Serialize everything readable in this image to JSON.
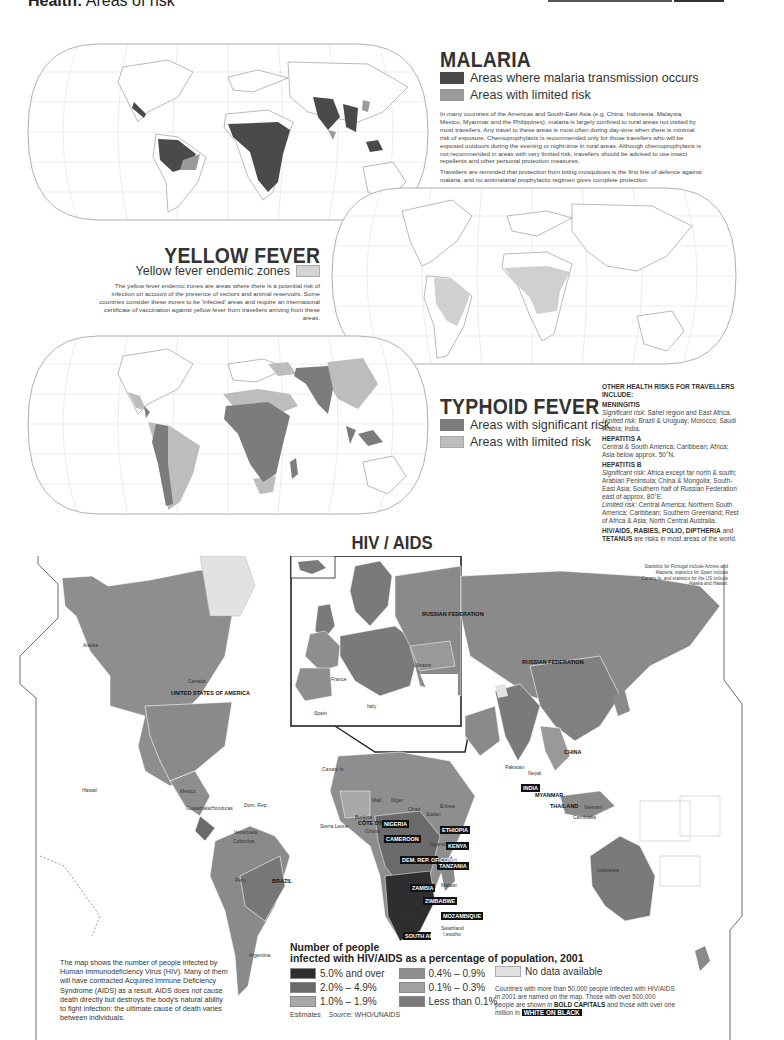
{
  "header": {
    "title_bold": "Health:",
    "title_light": " Areas of risk"
  },
  "colors": {
    "malaria_transmission": "#4a4a4a",
    "malaria_limited": "#9a9a9a",
    "yellow_fever": "#d4d4d4",
    "typhoid_significant": "#7c7c7c",
    "typhoid_limited": "#bdbdbd",
    "hiv_5_plus": "#2e2e2e",
    "hiv_2_4_9": "#6a6a6a",
    "hiv_1_1_9": "#a8a8a8",
    "hiv_0_4_0_9": "#8e8e8e",
    "hiv_0_1_0_3": "#a0a0a0",
    "hiv_lt_0_1": "#7a7a7a",
    "hiv_no_data": "#e2e2e2",
    "land": "#ffffff",
    "coast": "#8c8c8c",
    "grid": "#cfcfcf"
  },
  "malaria": {
    "title": "MALARIA",
    "legend": [
      {
        "label": "Areas where malaria transmission occurs",
        "color_key": "malaria_transmission"
      },
      {
        "label": "Areas with limited risk",
        "color_key": "malaria_limited"
      }
    ],
    "paragraphs": [
      "In many countries of the Americas and South-East Asia (e.g. China, Indonesia, Malaysia, Mexico, Myanmar and the Philippines), malaria is largely confined to rural areas not visited by most travellers. Any travel to these areas is most often during day-time when there is minimal risk of exposure. Chemoprophylaxis is recommended only for those travellers who will be exposed outdoors during the evening or night-time in rural areas. Although chemoprophylaxis is not recommended in areas with very limited risk, travellers should be advised to use insect repellents and other personal protection measures.",
      "Travellers are reminded that protection from biting mosquitoes is the first line of defence against malaria, and no antimalarial prophylactic regimen gives complete protection."
    ]
  },
  "yellow_fever": {
    "title": "YELLOW FEVER",
    "legend_label": "Yellow fever endemic zones",
    "paragraph": "The yellow fever endemic zones are areas where there is a potential risk of infection on account of the presence of vectors and animal reservoirs. Some countries consider these zones to be 'infected' areas and require an international certificate of vaccination against yellow fever from travellers arriving from these areas."
  },
  "typhoid": {
    "title": "TYPHOID FEVER",
    "legend": [
      {
        "label": "Areas with significant risk",
        "color_key": "typhoid_significant"
      },
      {
        "label": "Areas with limited risk",
        "color_key": "typhoid_limited"
      }
    ]
  },
  "other_risks": {
    "heading": "OTHER HEALTH RISKS FOR TRAVELLERS INCLUDE:",
    "meningitis": {
      "title": "MENINGITIS",
      "sig_label": "Significant risk:",
      "sig_text": " Sahel region and East Africa.",
      "lim_label": "Limited risk:",
      "lim_text": " Brazil & Uruguay; Morocco; Saudi Arabia; India."
    },
    "hepatitis_a": {
      "title": "HEPATITIS A",
      "text": "Central & South America; Caribbean; Africa; Asia below approx. 50°N."
    },
    "hepatitis_b": {
      "title": "HEPATITIS B",
      "sig_label": "Significant risk:",
      "sig_text": " Africa except far north & south; Arabian Peninsula; China & Mongolia; South-East Asia; Southern half of Russian Federation east of approx. 80°E.",
      "lim_label": "Limited risk:",
      "lim_text": " Central America; Northern South America; Caribbean; Southern Greenland; Rest of Africa & Asia; North Central Australia."
    },
    "general": {
      "bold": "HIV/AIDS, RABIES, POLIO, DIPTHERIA",
      "mid": " and ",
      "bold2": "TETANUS",
      "rest": " are risks in most areas of the world."
    }
  },
  "hiv": {
    "title": "HIV / AIDS",
    "stats_note": "Statistics for Portugal include Azores and Madeira, statistics for Spain include Canary Is. and statistics for the US include Alaska and Hawaii.",
    "intro": "The map shows the number of people infected by Human Immunodeficiency Virus (HIV). Many of them will have contracted Acquired Immune Deficiency Syndrome (AIDS) as a result. AIDS does not cause death directly but destroys the body's natural ability to fight infection: the ultimate cause of death varies between individuals.",
    "legend_title_1": "Number of people",
    "legend_title_2": "infected with HIV/AIDS as a percentage of population, 2001",
    "legend": [
      {
        "label": "5.0% and over",
        "color_key": "hiv_5_plus"
      },
      {
        "label": "2.0% – 4.9%",
        "color_key": "hiv_2_4_9"
      },
      {
        "label": "1.0% – 1.9%",
        "color_key": "hiv_1_1_9"
      },
      {
        "label": "0.4% – 0.9%",
        "color_key": "hiv_0_4_0_9"
      },
      {
        "label": "0.1% – 0.3%",
        "color_key": "hiv_0_1_0_3"
      },
      {
        "label": "Less than 0.1%",
        "color_key": "hiv_lt_0_1"
      }
    ],
    "no_data_label": "No data available",
    "estimates": "Estimates",
    "source_label": "Source:",
    "source_value": " WHO/UNAIDS",
    "naming_note": {
      "part1": "Countries with more than 50,000 people infected with HIV/AIDS in 2001 are named on the map. Those with over 500,000 people are shown in ",
      "bold": "BOLD CAPITALS",
      "part2": " and those with over one million in ",
      "wob": "WHITE ON BLACK"
    },
    "labels_plain": [
      "Alaska",
      "Canada",
      "Hawaii",
      "Mexico",
      "Guatemala",
      "Honduras",
      "Dom. Rep.",
      "Venezuela",
      "Colombia",
      "Peru",
      "Argentina",
      "Canary Is.",
      "Sierra Leone",
      "Mali",
      "Niger",
      "Chad",
      "Sudan",
      "Burkina",
      "Ghana",
      "Uganda",
      "Burundi",
      "Malawi",
      "Angola",
      "Namibia",
      "Swaziland",
      "Lesotho",
      "Eritrea",
      "France",
      "Spain",
      "Italy",
      "Ukraine",
      "Pakistan",
      "Nepal",
      "Vietnam",
      "Cambodia",
      "Indonesia"
    ],
    "labels_bold": [
      "UNITED STATES OF AMERICA",
      "BRAZIL",
      "RUSSIAN FEDERATION",
      "CHINA",
      "MYANMAR",
      "THAILAND",
      "CÔTE D'IVOIRE"
    ],
    "labels_wob": [
      "NIGERIA",
      "CAMEROON",
      "ETHIOPIA",
      "KENYA",
      "DEM. REP. OF CONGO",
      "TANZANIA",
      "ZAMBIA",
      "ZIMBABWE",
      "MOZAMBIQUE",
      "SOUTH AFRICA",
      "INDIA"
    ]
  }
}
